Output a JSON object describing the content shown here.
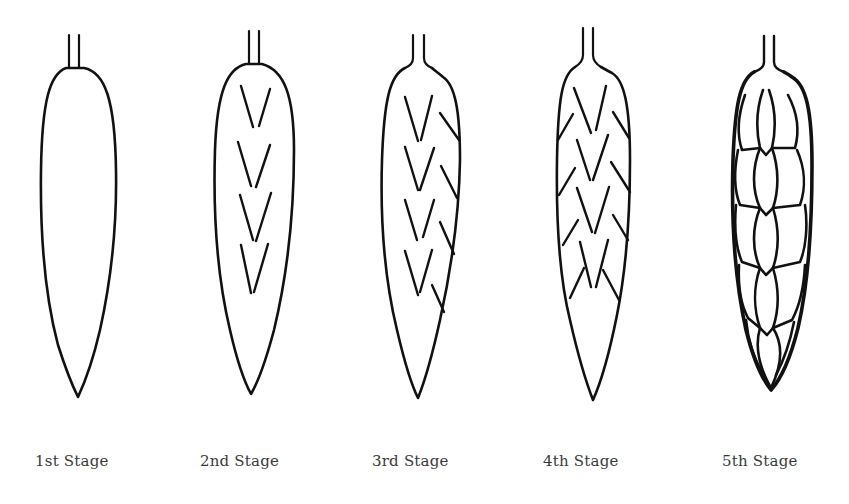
{
  "figure": {
    "type": "diagram",
    "stages": [
      {
        "label": "1st Stage",
        "description": "smooth undifferentiated spike outline"
      },
      {
        "label": "2nd Stage",
        "description": "four central V-shaped spikelet primordia"
      },
      {
        "label": "3rd Stage",
        "description": "central V marks plus right-side lateral ridges"
      },
      {
        "label": "4th Stage",
        "description": "central V marks plus lateral ridges on both sides"
      },
      {
        "label": "5th Stage",
        "description": "fully differentiated overlapping spikelets"
      }
    ],
    "stroke_color": "#111111",
    "label_color": "#3a3a3a",
    "background": "#ffffff"
  }
}
